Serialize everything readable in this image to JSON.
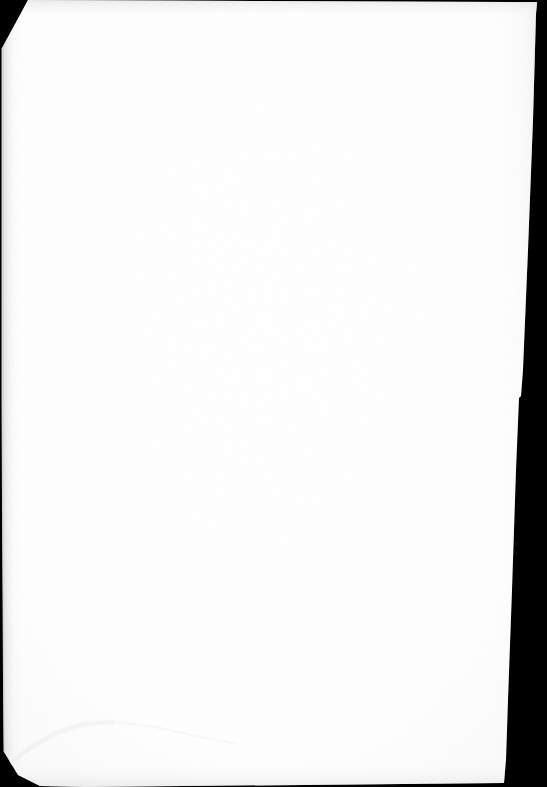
{
  "document": {
    "kind": "scanned-page",
    "title": "Scanned blank page",
    "page_content_text": "",
    "has_visible_text": false,
    "has_visible_graphics": false,
    "description": "A blank white sheet of paper photographed or scanned against a solid black background. The sheet is slightly rotated and its top-left and bottom-left corners are clipped; a faint fold crease runs across the lower-left area."
  },
  "canvas": {
    "width": 547,
    "height": 787,
    "background_color": "#000000"
  },
  "paper": {
    "fill_color": "#ffffff",
    "edge_shadow_color": "#d8d8d8",
    "crease_color": "#f2f2f2",
    "outline_points": "28,0 537,2 536,14 533,120 528,250 523,370 521,396 519,398 516,470 512,590 508,700 506,760 504,783 86,787 40,786 18,775 4,752 3,600 2,400 2,160 2,48",
    "corners": {
      "top_left_cut_from": "28,0",
      "top_left_cut_to": "2,48",
      "bottom_left_cut_from": "4,752",
      "bottom_left_cut_to": "40,786",
      "right_edge_notch_at_y": 397
    }
  },
  "annotations": {
    "crease_label": "fold crease",
    "crease_path": "M 6,766 L 30,748 L 56,733 L 84,724 L 112,722"
  }
}
